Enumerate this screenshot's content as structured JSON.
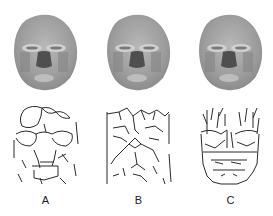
{
  "figure": {
    "panels": [
      {
        "label": "A",
        "face_image": "grayscale-3d-face-render",
        "feature_image": "facial-line-pattern-A"
      },
      {
        "label": "B",
        "face_image": "grayscale-3d-face-render",
        "feature_image": "facial-line-pattern-B"
      },
      {
        "label": "C",
        "face_image": "grayscale-3d-face-render",
        "feature_image": "facial-line-pattern-C"
      }
    ]
  },
  "colors": {
    "face_base": "#9a9a9a",
    "face_light": "#c8c8c8",
    "face_dark": "#4a4a4a",
    "line": "#2a2a2a",
    "background": "#ffffff"
  }
}
